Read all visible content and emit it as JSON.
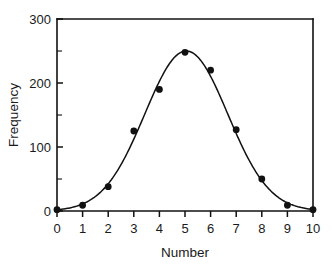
{
  "chart_data": {
    "type": "scatter",
    "title": "",
    "subtitle": "",
    "xlabel": "Number",
    "ylabel": "Frequency",
    "xlim": [
      0,
      10
    ],
    "ylim": [
      0,
      300
    ],
    "grid": false,
    "legend": null,
    "x_ticks": [
      0,
      1,
      2,
      3,
      4,
      5,
      6,
      7,
      8,
      9,
      10
    ],
    "x_tick_labels": [
      "0",
      "1",
      "2",
      "3",
      "4",
      "5",
      "6",
      "7",
      "8",
      "9",
      "10"
    ],
    "y_ticks": [
      0,
      100,
      200,
      300
    ],
    "y_tick_labels": [
      "0",
      "100",
      "200",
      "300"
    ],
    "y_minor_ticks": [
      50,
      150,
      250
    ],
    "x": [
      0,
      1,
      2,
      3,
      4,
      5,
      6,
      7,
      8,
      9,
      10
    ],
    "values": [
      2,
      9,
      38,
      125,
      190,
      248,
      220,
      127,
      50,
      9,
      2
    ],
    "series": [
      {
        "name": "Frequency",
        "marker": "filled-circle",
        "marker_color": "#111111",
        "values": [
          2,
          9,
          38,
          125,
          190,
          248,
          220,
          127,
          50,
          9,
          2
        ]
      },
      {
        "name": "Fitted curve",
        "type": "line",
        "line_color": "#111111",
        "fit": "gaussian",
        "fit_params": {
          "amplitude": 250,
          "mean": 5.05,
          "sigma": 1.62
        }
      }
    ],
    "annotations": [],
    "axis_color": "#111111",
    "background_color": "#ffffff"
  },
  "axes": {
    "x_title": "Number",
    "y_title": "Frequency"
  },
  "geometry": {
    "plot_left": 57,
    "plot_right": 313,
    "plot_top": 19,
    "plot_bottom": 211
  }
}
